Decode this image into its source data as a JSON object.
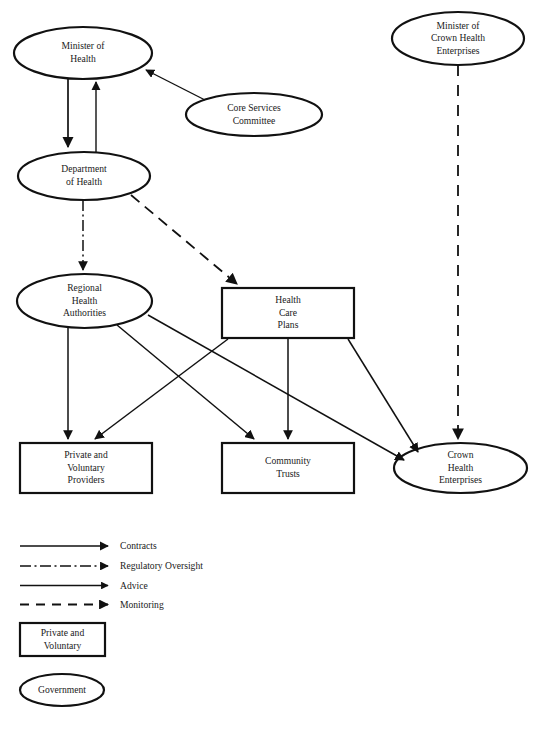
{
  "figure": {
    "type": "organisational-flow-diagram",
    "stroke_color": "#111111",
    "background": "#ffffff"
  },
  "nodes": [
    {
      "id": "minister-of-health",
      "label": "Minister of\nHealth",
      "shape": "ellipse",
      "category": "Government",
      "x": 14,
      "y": 27,
      "w": 138,
      "h": 52
    },
    {
      "id": "core-services-committee",
      "label": "Core Services\nCommittee",
      "shape": "ellipse",
      "category": "Government",
      "x": 186,
      "y": 93,
      "w": 136,
      "h": 43
    },
    {
      "id": "minister-of-crown-health",
      "label": "Minister of\nCrown Health\nEnterprises",
      "shape": "ellipse",
      "category": "Government",
      "x": 392,
      "y": 12,
      "w": 132,
      "h": 53
    },
    {
      "id": "department-of-health",
      "label": "Department\nof Health",
      "shape": "ellipse",
      "category": "Government",
      "x": 18,
      "y": 152,
      "w": 132,
      "h": 48
    },
    {
      "id": "regional-health-authorities",
      "label": "Regional\nHealth\nAuthorities",
      "shape": "ellipse",
      "category": "Government",
      "x": 17,
      "y": 274,
      "w": 135,
      "h": 54
    },
    {
      "id": "health-care-plans",
      "label": "Health\nCare\nPlans",
      "shape": "box",
      "category": "Private and Voluntary",
      "x": 222,
      "y": 288,
      "w": 132,
      "h": 50
    },
    {
      "id": "private-voluntary-providers",
      "label": "Private and\nVoluntary\nProviders",
      "shape": "box",
      "category": "Private and Voluntary",
      "x": 20,
      "y": 443,
      "w": 132,
      "h": 50
    },
    {
      "id": "community-trusts",
      "label": "Community\nTrusts",
      "shape": "box",
      "category": "Private and Voluntary",
      "x": 222,
      "y": 443,
      "w": 132,
      "h": 50
    },
    {
      "id": "crown-health-enterprises",
      "label": "Crown\nHealth\nEnterprises",
      "shape": "ellipse",
      "category": "Government",
      "x": 394,
      "y": 443,
      "w": 133,
      "h": 50
    }
  ],
  "edges": [
    {
      "from": "minister-of-health",
      "to": "department-of-health",
      "relation": "Contracts"
    },
    {
      "from": "department-of-health",
      "to": "minister-of-health",
      "relation": "Advice"
    },
    {
      "from": "core-services-committee",
      "to": "minister-of-health",
      "relation": "Advice"
    },
    {
      "from": "department-of-health",
      "to": "regional-health-authorities",
      "relation": "Regulatory Oversight"
    },
    {
      "from": "department-of-health",
      "to": "health-care-plans",
      "relation": "Monitoring"
    },
    {
      "from": "minister-of-crown-health",
      "to": "crown-health-enterprises",
      "relation": "Monitoring"
    },
    {
      "from": "regional-health-authorities",
      "to": "private-voluntary-providers",
      "relation": "Contracts"
    },
    {
      "from": "regional-health-authorities",
      "to": "community-trusts",
      "relation": "Contracts"
    },
    {
      "from": "regional-health-authorities",
      "to": "crown-health-enterprises",
      "relation": "Contracts"
    },
    {
      "from": "health-care-plans",
      "to": "private-voluntary-providers",
      "relation": "Contracts"
    },
    {
      "from": "health-care-plans",
      "to": "community-trusts",
      "relation": "Contracts"
    },
    {
      "from": "health-care-plans",
      "to": "crown-health-enterprises",
      "relation": "Contracts"
    }
  ],
  "legend": {
    "lines": [
      {
        "id": "contracts",
        "label": "Contracts",
        "style": "solid-thick"
      },
      {
        "id": "regulatory-oversight",
        "label": "Regulatory Oversight",
        "style": "dash-dot"
      },
      {
        "id": "advice",
        "label": "Advice",
        "style": "solid-thin"
      },
      {
        "id": "monitoring",
        "label": "Monitoring",
        "style": "dashed"
      }
    ],
    "shapes": [
      {
        "id": "private-voluntary-key",
        "label": "Private and\nVoluntary",
        "shape": "box"
      },
      {
        "id": "government-key",
        "label": "Government",
        "shape": "ellipse"
      }
    ]
  }
}
